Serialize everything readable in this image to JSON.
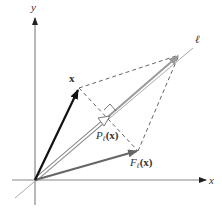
{
  "diagram": {
    "labels": {
      "y_axis": "y",
      "x_axis": "x",
      "line": "ℓ",
      "vector": "x",
      "projection_P": "P",
      "projection_sub": "ℓ",
      "projection_arg": "(x)",
      "reflection_F": "F",
      "reflection_sub": "ℓ",
      "reflection_arg": "(x)"
    },
    "colors": {
      "axes": "#777777",
      "vector_x": "#111111",
      "reflection": "#666666",
      "line_l": "#999999",
      "projection": "#888888",
      "dashed": "#555555"
    },
    "points": {
      "origin": [
        35,
        180
      ],
      "x_tip": [
        79,
        88
      ],
      "reflection_tip": [
        138,
        151
      ],
      "projection_tip": [
        110,
        116
      ],
      "sum_tip": [
        179,
        55
      ],
      "line_start": [
        15,
        198
      ],
      "line_end": [
        193,
        48
      ]
    }
  }
}
